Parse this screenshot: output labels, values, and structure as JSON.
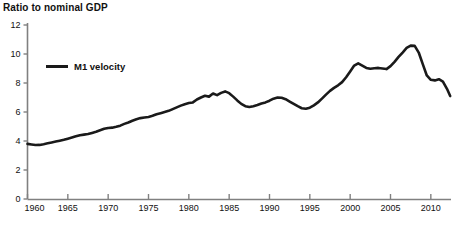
{
  "chart_data": {
    "type": "line",
    "title": "Ratio to nominal GDP",
    "xlabel": "",
    "ylabel": "",
    "grid": false,
    "legend_position": "inside-top-left",
    "xlim": [
      1960,
      2012.5
    ],
    "ylim": [
      0,
      12
    ],
    "yticks": [
      0,
      2,
      4,
      6,
      8,
      10,
      12
    ],
    "ytick_labels": [
      "0",
      "2",
      "4",
      "6",
      "8",
      "10",
      "12"
    ],
    "xticks": [
      1960,
      1965,
      1970,
      1975,
      1980,
      1985,
      1990,
      1995,
      2000,
      2005,
      2010
    ],
    "xtick_labels": [
      "1960",
      "1965",
      "1970",
      "1975",
      "1980",
      "1985",
      "1990",
      "1995",
      "2000",
      "2005",
      "2010"
    ],
    "series": [
      {
        "name": "M1 velocity",
        "color": "#1a1a1a",
        "x": [
          1960.0,
          1960.5,
          1961.0,
          1961.5,
          1962.0,
          1962.5,
          1963.0,
          1963.5,
          1964.0,
          1964.5,
          1965.0,
          1965.5,
          1966.0,
          1966.5,
          1967.0,
          1967.5,
          1968.0,
          1968.5,
          1969.0,
          1969.5,
          1970.0,
          1970.5,
          1971.0,
          1971.5,
          1972.0,
          1972.5,
          1973.0,
          1973.5,
          1974.0,
          1974.5,
          1975.0,
          1975.5,
          1976.0,
          1976.5,
          1977.0,
          1977.5,
          1978.0,
          1978.5,
          1979.0,
          1979.5,
          1980.0,
          1980.5,
          1981.0,
          1981.5,
          1982.0,
          1982.5,
          1983.0,
          1983.5,
          1984.0,
          1984.5,
          1985.0,
          1985.5,
          1986.0,
          1986.5,
          1987.0,
          1987.5,
          1988.0,
          1988.5,
          1989.0,
          1989.5,
          1990.0,
          1990.5,
          1991.0,
          1991.5,
          1992.0,
          1992.5,
          1993.0,
          1993.5,
          1994.0,
          1994.5,
          1995.0,
          1995.5,
          1996.0,
          1996.5,
          1997.0,
          1997.5,
          1998.0,
          1998.5,
          1999.0,
          1999.5,
          2000.0,
          2000.5,
          2001.0,
          2001.5,
          2002.0,
          2002.5,
          2003.0,
          2003.5,
          2004.0,
          2004.5,
          2005.0,
          2005.5,
          2006.0,
          2006.5,
          2007.0,
          2007.5,
          2008.0,
          2008.5,
          2009.0,
          2009.5,
          2010.0,
          2010.5,
          2011.0,
          2011.5,
          2012.0,
          2012.4
        ],
        "values": [
          3.8,
          3.76,
          3.72,
          3.73,
          3.78,
          3.84,
          3.9,
          3.96,
          4.02,
          4.08,
          4.16,
          4.24,
          4.32,
          4.4,
          4.44,
          4.48,
          4.56,
          4.64,
          4.74,
          4.84,
          4.9,
          4.92,
          4.98,
          5.06,
          5.18,
          5.28,
          5.4,
          5.5,
          5.58,
          5.62,
          5.66,
          5.74,
          5.84,
          5.92,
          6.0,
          6.08,
          6.2,
          6.32,
          6.44,
          6.54,
          6.62,
          6.66,
          6.86,
          7.0,
          7.12,
          7.06,
          7.28,
          7.16,
          7.32,
          7.42,
          7.3,
          7.06,
          6.8,
          6.56,
          6.4,
          6.34,
          6.4,
          6.48,
          6.58,
          6.66,
          6.78,
          6.92,
          7.0,
          6.98,
          6.88,
          6.72,
          6.56,
          6.4,
          6.26,
          6.22,
          6.3,
          6.46,
          6.66,
          6.92,
          7.2,
          7.46,
          7.66,
          7.84,
          8.06,
          8.4,
          8.8,
          9.2,
          9.36,
          9.2,
          9.04,
          8.98,
          9.02,
          9.04,
          9.0,
          8.96,
          9.16,
          9.46,
          9.8,
          10.1,
          10.42,
          10.58,
          10.56,
          10.1,
          9.3,
          8.52,
          8.22,
          8.18,
          8.26,
          8.1,
          7.6,
          7.1
        ]
      }
    ],
    "annotations": []
  },
  "legend": {
    "label": "M1 velocity"
  }
}
